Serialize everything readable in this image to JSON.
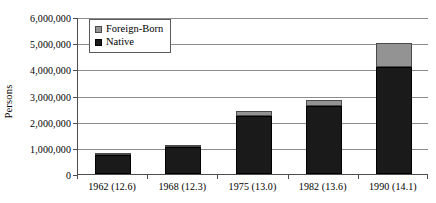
{
  "chart_data": {
    "type": "bar",
    "title": "",
    "subtitle": "",
    "xlabel": "",
    "ylabel": "Persons",
    "stacked": true,
    "grid": true,
    "legend_position": "top-left-inside",
    "ylim": [
      0,
      6000000
    ],
    "ytick_values": [
      0,
      1000000,
      2000000,
      3000000,
      4000000,
      5000000,
      6000000
    ],
    "ytick_labels": [
      "0",
      "1,000,000",
      "2,000,000",
      "3,000,000",
      "4,000,000",
      "5,000,000",
      "6,000,000"
    ],
    "categories": [
      "1962 (12.6)",
      "1968 (12.3)",
      "1975 (13.0)",
      "1982 (13.6)",
      "1990 (14.1)"
    ],
    "series": [
      {
        "name": "Native",
        "color": "#1a1a1a",
        "values": [
          730000,
          1020000,
          2200000,
          2600000,
          4100000
        ]
      },
      {
        "name": "Foreign-Born",
        "color": "#939393",
        "values": [
          40000,
          90000,
          220000,
          240000,
          900000
        ]
      }
    ],
    "totals": [
      770000,
      1110000,
      2420000,
      2840000,
      5000000
    ]
  },
  "legend": {
    "items": [
      {
        "label": "Foreign-Born",
        "swatch": "foreign"
      },
      {
        "label": "Native",
        "swatch": "native"
      }
    ]
  },
  "colors": {
    "native": "#1a1a1a",
    "foreign_born": "#939393",
    "gridline": "#8c8c8c",
    "axis": "#4d4d4d",
    "background": "#ffffff"
  }
}
